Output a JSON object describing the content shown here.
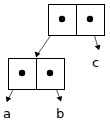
{
  "diagram": {
    "type": "box-and-pointer",
    "background_color": "#ffffff",
    "stroke_color": "#000000",
    "pointer_line_color": "#555555",
    "cells": [
      {
        "id": "top-cell",
        "name": "top-cons-cell",
        "x": 48,
        "y": 4,
        "width": 57,
        "height": 32,
        "divider_x": 76,
        "slots": [
          {
            "id": "top-car",
            "name": "top-cell-car-slot",
            "dot_x": 62,
            "dot_y": 19,
            "target": "bottom-cell",
            "label": ""
          },
          {
            "id": "top-cdr",
            "name": "top-cell-cdr-slot",
            "dot_x": 90,
            "dot_y": 19,
            "target": "c",
            "label": "c"
          }
        ]
      },
      {
        "id": "bottom-cell",
        "name": "bottom-cons-cell",
        "x": 8,
        "y": 58,
        "width": 57,
        "height": 32,
        "divider_x": 36,
        "slots": [
          {
            "id": "bottom-car",
            "name": "bottom-cell-car-slot",
            "dot_x": 22,
            "dot_y": 73,
            "target": "a",
            "label": "a"
          },
          {
            "id": "bottom-cdr",
            "name": "bottom-cell-cdr-slot",
            "dot_x": 50,
            "dot_y": 73,
            "target": "b",
            "label": "b"
          }
        ]
      }
    ],
    "arrows": [
      {
        "id": "arrow-top-car-to-bottom-cell",
        "name": "arrow-top-car-to-bottom-cell",
        "from_x": 62,
        "from_y": 19,
        "to_x": 36.5,
        "to_y": 57,
        "points_to": "bottom-cons-cell"
      },
      {
        "id": "arrow-top-cdr-to-c",
        "name": "arrow-top-cdr-to-c",
        "from_x": 90,
        "from_y": 19,
        "to_x": 99,
        "to_y": 50,
        "points_to": "c"
      },
      {
        "id": "arrow-bottom-car-to-a",
        "name": "arrow-bottom-car-to-a",
        "from_x": 22,
        "from_y": 73,
        "to_x": 7,
        "to_y": 102,
        "points_to": "a"
      },
      {
        "id": "arrow-bottom-cdr-to-b",
        "name": "arrow-bottom-cdr-to-b",
        "from_x": 50,
        "from_y": 73,
        "to_x": 61,
        "to_y": 101,
        "points_to": "b"
      }
    ],
    "labels": [
      {
        "id": "label-a",
        "name": "variable-label-a",
        "text": "a",
        "x": 3,
        "y": 118
      },
      {
        "id": "label-b",
        "name": "variable-label-b",
        "text": "b",
        "x": 56,
        "y": 118
      },
      {
        "id": "label-c",
        "name": "variable-label-c",
        "text": "c",
        "x": 92,
        "y": 67
      }
    ]
  }
}
